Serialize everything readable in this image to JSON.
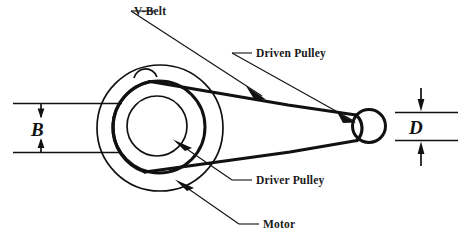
{
  "figure": {
    "type": "mechanical-diagram",
    "background_color": "#ffffff",
    "line_color": "#111111"
  },
  "callouts": [
    {
      "id": "v-belt",
      "label": "V-Belt",
      "points_to": "upper-belt-span"
    },
    {
      "id": "driven-pulley",
      "label": "Driven Pulley",
      "points_to": "small-right-pulley"
    },
    {
      "id": "driver-pulley",
      "label": "Driver Pulley",
      "points_to": "large-middle-pulley"
    },
    {
      "id": "motor",
      "label": "Motor",
      "points_to": "motor-outer-body"
    }
  ],
  "dimensions": [
    {
      "id": "B",
      "label": "B",
      "side": "left",
      "description": "Motor / driver pulley diameter",
      "arrow_style": "inward-double"
    },
    {
      "id": "D",
      "label": "D",
      "side": "right",
      "description": "Driven pulley diameter",
      "arrow_style": "outward-double"
    }
  ],
  "components": [
    {
      "id": "motor-outer-body",
      "shape": "circle",
      "cx": 160,
      "cy": 128,
      "r": 64
    },
    {
      "id": "large-middle-pulley",
      "shape": "circle",
      "cx": 160,
      "cy": 128,
      "r": 46
    },
    {
      "id": "driver-hub",
      "shape": "circle",
      "cx": 158,
      "cy": 127,
      "r": 30
    },
    {
      "id": "motor-top-boss",
      "shape": "arc",
      "cx": 145,
      "cy": 66,
      "r": 11
    },
    {
      "id": "small-right-pulley",
      "shape": "circle",
      "cx": 369,
      "cy": 126,
      "r": 17
    }
  ],
  "belt": {
    "id": "v-belt-spans",
    "upper_span": {
      "x1": 176,
      "y1": 103,
      "x2": 358,
      "y2": 116
    },
    "lower_span": {
      "x1": 170,
      "y1": 156,
      "x2": 360,
      "y2": 140
    }
  }
}
